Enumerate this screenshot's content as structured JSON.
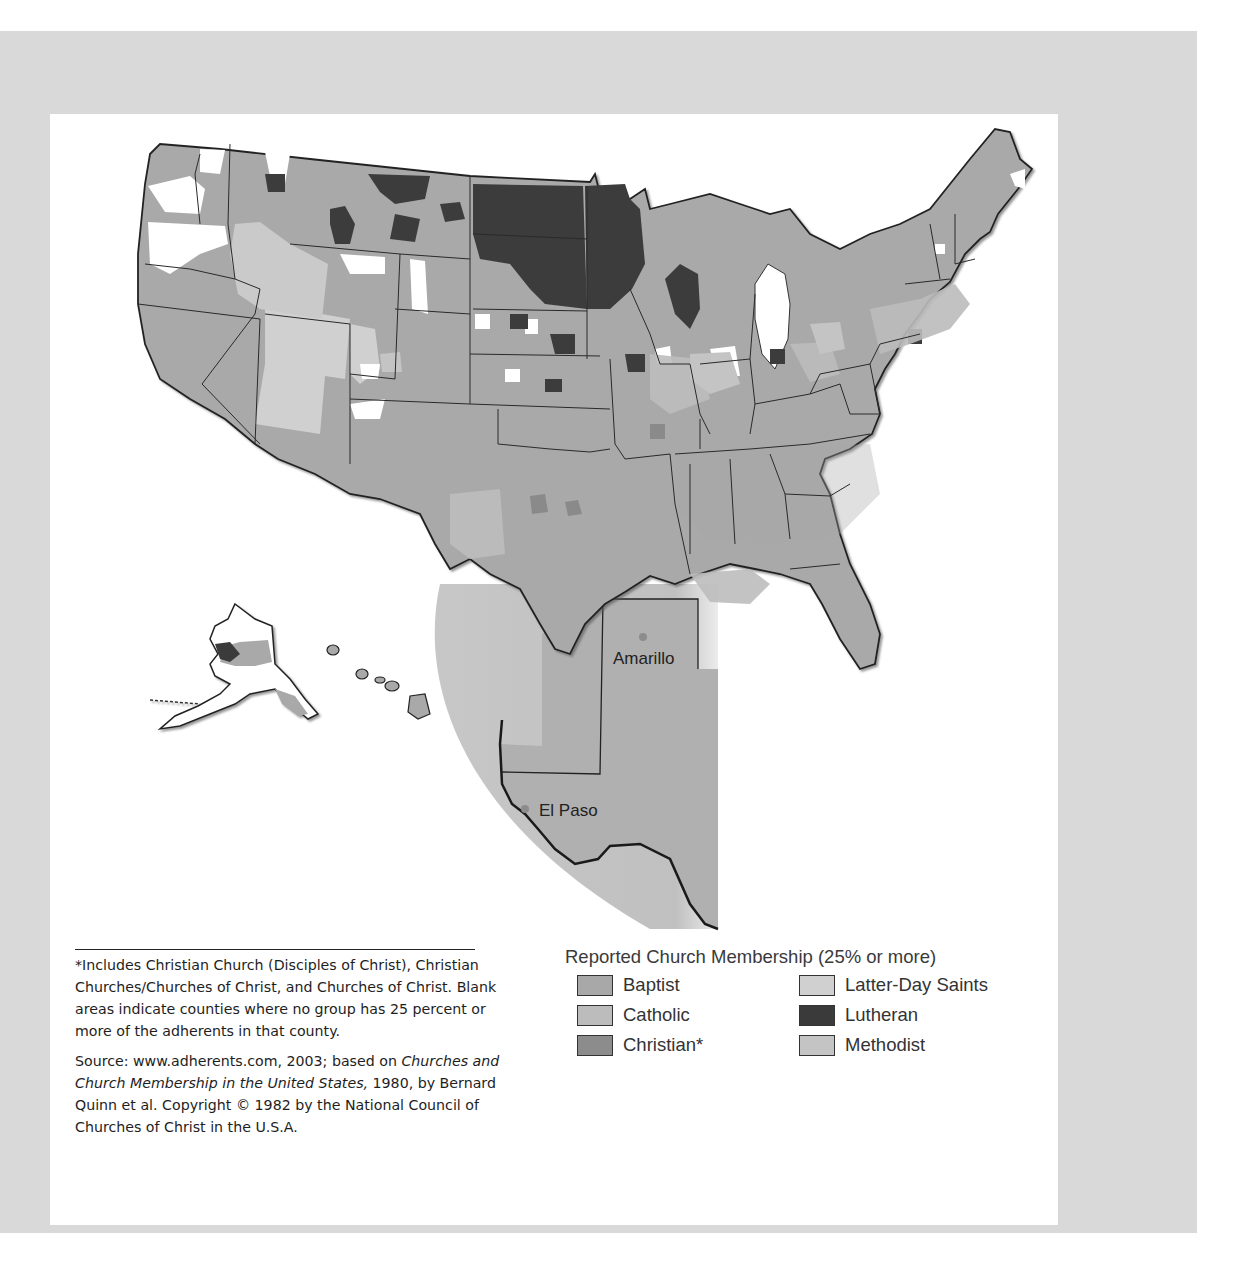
{
  "page": {
    "header_fragment": "...ge   9 9"
  },
  "map": {
    "title": "Reported Church Membership (25% or more)",
    "inset_cities": [
      {
        "name": "Amarillo"
      },
      {
        "name": "El Paso"
      }
    ],
    "colors": {
      "baptist": "#a8a8a8",
      "catholic": "#bcbcbc",
      "christian": "#8c8c8c",
      "latter_day_saints": "#d0d0d0",
      "lutheran": "#3a3a3a",
      "methodist": "#c4c4c4",
      "blank": "#ffffff",
      "frame": "#d9d9d9"
    }
  },
  "legend": {
    "title": "Reported Church Membership (25% or more)",
    "items": [
      {
        "label": "Baptist",
        "color": "#a8a8a8"
      },
      {
        "label": "Latter-Day Saints",
        "color": "#d0d0d0"
      },
      {
        "label": "Catholic",
        "color": "#bcbcbc"
      },
      {
        "label": "Lutheran",
        "color": "#3a3a3a"
      },
      {
        "label": "Christian*",
        "color": "#8c8c8c"
      },
      {
        "label": "Methodist",
        "color": "#c4c4c4"
      }
    ]
  },
  "footnote": {
    "asterisk_note": "*Includes Christian Church (Disciples of Christ), Christian Churches/Churches of Christ, and Churches of Christ. Blank areas indicate counties where no group has 25 percent or more of the adherents in that county.",
    "source_prefix": "Source: www.adherents.com, 2003; based on ",
    "source_title": "Churches and Church Membership in the United States,",
    "source_suffix": " 1980, by Bernard Quinn et al. Copyright © 1982 by the National Council of Churches of Christ in the U.S.A."
  }
}
